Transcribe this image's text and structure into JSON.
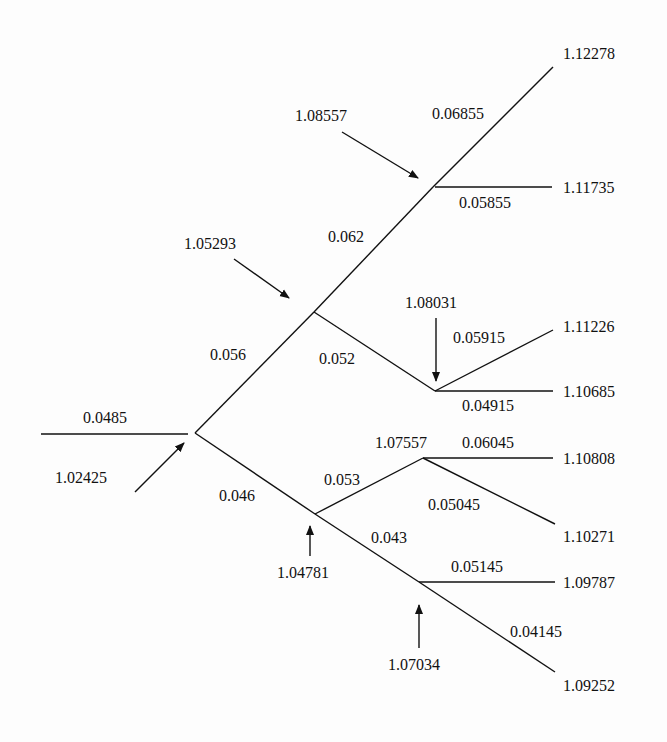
{
  "diagram": {
    "type": "binomial interest rate tree",
    "root_branch_rate": "0.0485",
    "nodes": [
      {
        "id": "n0",
        "value": "1.02425"
      },
      {
        "id": "n_u",
        "value": "1.05293"
      },
      {
        "id": "n_d",
        "value": "1.04781"
      },
      {
        "id": "n_uu",
        "value": "1.08557"
      },
      {
        "id": "n_ud",
        "value": "1.08031"
      },
      {
        "id": "n_du",
        "value": "1.07557"
      },
      {
        "id": "n_dd",
        "value": "1.07034"
      }
    ],
    "leaves": [
      "1.12278",
      "1.11735",
      "1.11226",
      "1.10685",
      "1.10808",
      "1.10271",
      "1.09787",
      "1.09252"
    ],
    "branch_rates": {
      "r_u": "0.056",
      "r_d": "0.046",
      "r_uu": "0.062",
      "r_ud": "0.052",
      "r_du": "0.053",
      "r_dd": "0.043",
      "r_uuu": "0.06855",
      "r_uud": "0.05855",
      "r_udu": "0.05915",
      "r_udd": "0.04915",
      "r_duu": "0.06045",
      "r_dud": "0.05045",
      "r_ddu": "0.05145",
      "r_ddd": "0.04145"
    },
    "colors": {
      "line": "#111111",
      "background": "#fdfdfd"
    }
  }
}
